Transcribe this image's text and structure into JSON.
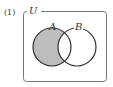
{
  "problem_number": "(1)",
  "universal_set_label": "U",
  "sets": [
    {
      "label": "A",
      "cx": 52,
      "cy": 47,
      "r": 19
    },
    {
      "label": "B",
      "cx": 77,
      "cy": 47,
      "r": 19
    }
  ],
  "shaded_region": "A minus B",
  "colors": {
    "shade": "#bdbdbd",
    "stroke": "#333333",
    "box": "#777777"
  }
}
